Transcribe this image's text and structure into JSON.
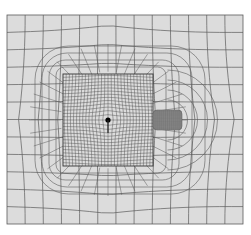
{
  "diagram": {
    "type": "finite-element-mesh",
    "background_color": "#ffffff",
    "domain_fill": "#dcdcdc",
    "line_color": "#5a5a5a",
    "fine_line_color": "#4a4a4a",
    "dot_color": "#000000",
    "outer_domain": {
      "x": 7,
      "y": 15,
      "w": 236,
      "h": 209,
      "cols": 13,
      "rows": 12
    },
    "inner_region": {
      "x": 63,
      "y": 74,
      "w": 90,
      "h": 92,
      "divisions": 28
    },
    "refined_block": {
      "x": 153,
      "y": 110,
      "w": 29,
      "h": 20,
      "divisions": 14
    },
    "source_point": {
      "x": 108,
      "y": 120,
      "r": 2.6
    },
    "transition_rings": 4
  }
}
